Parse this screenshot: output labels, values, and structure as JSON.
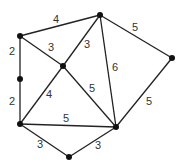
{
  "graph": {
    "nodes": [
      {
        "id": "A",
        "x": 20,
        "y": 36
      },
      {
        "id": "B",
        "x": 100,
        "y": 15
      },
      {
        "id": "C",
        "x": 63,
        "y": 66
      },
      {
        "id": "D",
        "x": 20,
        "y": 79
      },
      {
        "id": "E",
        "x": 172,
        "y": 58
      },
      {
        "id": "F",
        "x": 20,
        "y": 124
      },
      {
        "id": "G",
        "x": 116,
        "y": 127
      },
      {
        "id": "H",
        "x": 69,
        "y": 157
      }
    ],
    "edges": [
      {
        "from": "A",
        "to": "B",
        "weight": "4",
        "lx": 56,
        "ly": 20
      },
      {
        "from": "A",
        "to": "C",
        "weight": "3",
        "lx": 51,
        "ly": 48
      },
      {
        "from": "A",
        "to": "D",
        "weight": "2",
        "lx": 12,
        "ly": 52
      },
      {
        "from": "D",
        "to": "F",
        "weight": "2",
        "lx": 12,
        "ly": 102
      },
      {
        "from": "B",
        "to": "C",
        "weight": "3",
        "lx": 87,
        "ly": 45
      },
      {
        "from": "B",
        "to": "G",
        "weight": "6",
        "lx": 115,
        "ly": 68
      },
      {
        "from": "B",
        "to": "E",
        "weight": "5",
        "lx": 135,
        "ly": 28
      },
      {
        "from": "C",
        "to": "F",
        "weight": "4",
        "lx": 49,
        "ly": 95
      },
      {
        "from": "C",
        "to": "G",
        "weight": "5",
        "lx": 92,
        "ly": 89
      },
      {
        "from": "F",
        "to": "G",
        "weight": "5",
        "lx": 66,
        "ly": 119
      },
      {
        "from": "E",
        "to": "G",
        "weight": "5",
        "lx": 149,
        "ly": 102
      },
      {
        "from": "F",
        "to": "H",
        "weight": "3",
        "lx": 40,
        "ly": 145
      },
      {
        "from": "H",
        "to": "G",
        "weight": "3",
        "lx": 98,
        "ly": 146
      }
    ]
  }
}
